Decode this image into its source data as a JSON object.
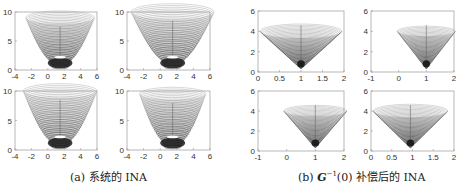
{
  "figure": {
    "captions": {
      "a": {
        "label": "(a)",
        "text": "系统的 INA"
      },
      "b": {
        "label": "(b)",
        "math": "G",
        "sup": "−1",
        "arg": "(0)",
        "text": "补偿后的 INA"
      }
    }
  },
  "chart_data": [
    {
      "type": "contour-surface",
      "group": "a",
      "position": "top-left",
      "xlim": [
        -4,
        6
      ],
      "ylim": [
        0,
        10
      ],
      "xticks": [
        "-4",
        "-2",
        "0",
        "2",
        "4",
        "6"
      ],
      "yticks": [
        "0",
        "5",
        "10"
      ],
      "center_x": 1.5,
      "top_y": 9,
      "top_halfwidth": 4.2,
      "neck_y": 2,
      "neck_halfwidth": 1.5
    },
    {
      "type": "contour-surface",
      "group": "a",
      "position": "top-right",
      "xlim": [
        -4,
        6
      ],
      "ylim": [
        0,
        10
      ],
      "xticks": [
        "-4",
        "-2",
        "0",
        "2",
        "4",
        "6"
      ],
      "yticks": [
        "0",
        "5",
        "10"
      ],
      "center_x": 1.5,
      "top_y": 10,
      "top_halfwidth": 5.0,
      "neck_y": 2,
      "neck_halfwidth": 1.5
    },
    {
      "type": "contour-surface",
      "group": "a",
      "position": "bottom-left",
      "xlim": [
        -4,
        6
      ],
      "ylim": [
        0,
        10
      ],
      "xticks": [
        "-4",
        "-2",
        "0",
        "2",
        "4",
        "6"
      ],
      "yticks": [
        "0",
        "5",
        "10"
      ],
      "center_x": 1.5,
      "top_y": 10,
      "top_halfwidth": 4.5,
      "neck_y": 2,
      "neck_halfwidth": 1.5
    },
    {
      "type": "contour-surface",
      "group": "a",
      "position": "bottom-right",
      "xlim": [
        -4,
        6
      ],
      "ylim": [
        0,
        10
      ],
      "xticks": [
        "-4",
        "-2",
        "0",
        "2",
        "4",
        "6"
      ],
      "yticks": [
        "0",
        "5",
        "10"
      ],
      "center_x": 1.5,
      "top_y": 9.5,
      "top_halfwidth": 4.0,
      "neck_y": 2,
      "neck_halfwidth": 1.5
    },
    {
      "type": "contour-cone",
      "group": "b",
      "position": "top-left",
      "xlim": [
        0,
        2
      ],
      "ylim": [
        0,
        6
      ],
      "xticks": [
        "0",
        "0.5",
        "1",
        "1.5",
        "2"
      ],
      "yticks": [
        "0",
        "2",
        "4",
        "6"
      ],
      "apex_x": 1.0,
      "top_y": 4,
      "top_halfwidth": 0.95
    },
    {
      "type": "contour-cone",
      "group": "b",
      "position": "top-right",
      "xlim": [
        -1,
        2
      ],
      "ylim": [
        0,
        6
      ],
      "xticks": [
        "-1",
        "0",
        "1",
        "2"
      ],
      "yticks": [
        "0",
        "2",
        "4",
        "6"
      ],
      "apex_x": 1.0,
      "top_y": 4,
      "top_halfwidth": 1.05
    },
    {
      "type": "contour-cone",
      "group": "b",
      "position": "bottom-left",
      "xlim": [
        -1,
        2
      ],
      "ylim": [
        0,
        6
      ],
      "xticks": [
        "-1",
        "0",
        "1",
        "2"
      ],
      "yticks": [
        "0",
        "2",
        "4",
        "6"
      ],
      "apex_x": 1.0,
      "top_y": 4,
      "top_halfwidth": 1.1
    },
    {
      "type": "contour-cone",
      "group": "b",
      "position": "bottom-right",
      "xlim": [
        0,
        2
      ],
      "ylim": [
        0,
        6
      ],
      "xticks": [
        "0",
        "0.5",
        "1",
        "1.5",
        "2"
      ],
      "yticks": [
        "0",
        "2",
        "4",
        "6"
      ],
      "apex_x": 0.95,
      "top_y": 4,
      "top_halfwidth": 0.9
    }
  ],
  "colors": {
    "axis": "#999999",
    "contour_light": "#aaaaaa",
    "contour_dark": "#111111"
  }
}
